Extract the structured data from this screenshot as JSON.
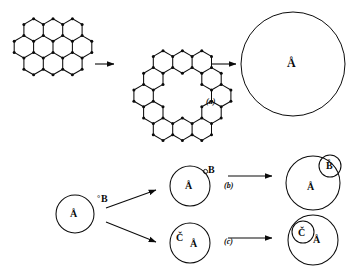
{
  "figure": {
    "type": "scientific-schematic",
    "background_color": "#ffffff",
    "ink_color": "#0b0b0b",
    "panels": [
      {
        "tag": "(a)",
        "description": "graphene flake to hexagonal ring to filled sphere",
        "steps": [
          "triangular-hexagon-flake",
          "hexagonal-ring",
          "large-circle"
        ]
      },
      {
        "tag": "(b)",
        "description": "species A sphere with external B becomes sphere containing small B domain"
      },
      {
        "tag": "(c)",
        "description": "species C and A sphere becomes sphere with inner C domain"
      }
    ]
  },
  "panel_a": {
    "tag": "(a)",
    "flake": {
      "name": "triangular graphene flake",
      "hex_rows": [
        3,
        4,
        3
      ],
      "vertex_dot_radius": 1.5
    },
    "ring": {
      "name": "hexagonal ring",
      "ring_count": 12,
      "vertex_dot_radius": 1.5
    },
    "sphere": {
      "label": "Å",
      "radius": 52
    },
    "arrows": 2
  },
  "panel_b": {
    "tag": "(b)",
    "source": {
      "inner_label": "Å",
      "outer_label": "B",
      "outer_prefix": "°"
    },
    "middle": {
      "inner_label": "Å",
      "edge_label": "B",
      "edge_prefix": "°"
    },
    "result": {
      "main_label": "Å",
      "inclusion_label": "B̊"
    }
  },
  "panel_c": {
    "tag": "(c)",
    "middle": {
      "first_label": "Č",
      "second_label": "Å"
    },
    "result": {
      "inclusion_label": "Č",
      "main_label": "Å"
    }
  },
  "labels": {
    "a_tag": "(a)",
    "b_tag": "(b)",
    "c_tag": "(c)",
    "A_ring": "Å",
    "B_plain": "B",
    "B_ring": "B̊",
    "C_ring": "Č",
    "degree": "°"
  }
}
